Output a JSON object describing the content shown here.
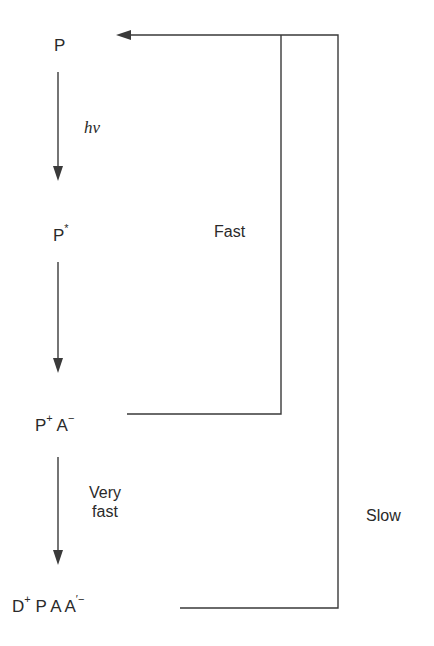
{
  "diagram": {
    "type": "reaction-scheme",
    "colors": {
      "line": "#3a3a3a",
      "text": "#2a2a2a",
      "background": "#ffffff"
    },
    "states": [
      {
        "id": "P",
        "base": "P",
        "sup": ""
      },
      {
        "id": "P_star",
        "base": "P",
        "sup": "*"
      },
      {
        "id": "P_plus_A_minus",
        "parts": [
          {
            "base": "P",
            "sup": "+"
          },
          {
            "base": "A",
            "sup": "−"
          }
        ]
      },
      {
        "id": "D_plus_P_A_Aprime_minus",
        "parts": [
          {
            "base": "D",
            "sup": "+"
          },
          {
            "base": "P",
            "sup": ""
          },
          {
            "base": "A",
            "sup": ""
          },
          {
            "base": "A",
            "sup": "′−"
          }
        ]
      }
    ],
    "transitions": [
      {
        "from": "P",
        "to": "P_star",
        "label": "hν"
      },
      {
        "from": "P_star",
        "to": "P_plus_A_minus",
        "label": ""
      },
      {
        "from": "P_plus_A_minus",
        "to": "D_plus_P_A_Aprime_minus",
        "label_line1": "Very",
        "label_line2": "fast"
      }
    ],
    "return_paths": [
      {
        "from": "P_plus_A_minus",
        "to": "P",
        "label": "Fast"
      },
      {
        "from": "D_plus_P_A_Aprime_minus",
        "to": "P",
        "label": "Slow"
      }
    ]
  }
}
